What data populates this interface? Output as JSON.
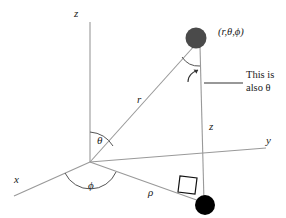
{
  "figure": {
    "background_color": "#ffffff",
    "line_color": "#808080",
    "dark_line_color": "#222222",
    "text_color": "#1a1a1a",
    "point_top_color": "#4a4a4a",
    "point_bottom_color": "#000000"
  },
  "labels": {
    "axis_z": "z",
    "axis_y": "y",
    "axis_x": "x",
    "radius_r": "r",
    "height_z": "z",
    "rho": "ρ",
    "theta": "θ",
    "phi": "ϕ",
    "point_coords": "(r,θ,ϕ)",
    "callout_line1": "This is",
    "callout_line2": "also θ"
  },
  "geometry": {
    "origin": [
      90,
      162
    ],
    "z_axis_top": [
      90,
      22
    ],
    "y_axis_end": [
      266,
      148
    ],
    "x_axis_end": [
      14,
      196
    ],
    "point_top": [
      196,
      40
    ],
    "point_bottom": [
      205,
      205
    ],
    "rho_end": [
      205,
      205
    ],
    "theta_arc_radius": 30,
    "phi_arc_radius": 28
  }
}
